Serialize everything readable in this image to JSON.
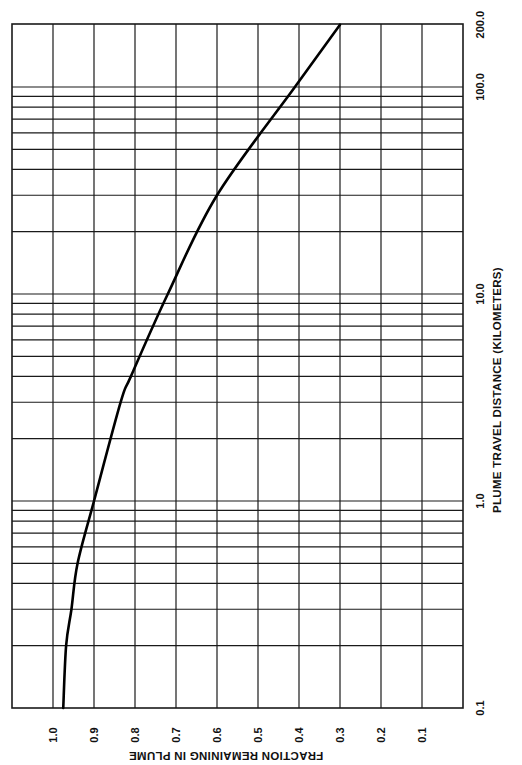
{
  "chart_data": {
    "type": "line",
    "orientation": "rotated-90-clockwise",
    "title": "",
    "xlabel": "PLUME TRAVEL DISTANCE (KILOMETERS)",
    "ylabel": "FRACTION REMAINING IN PLUME",
    "x_scale": "log",
    "xlim": [
      0.1,
      200.0
    ],
    "ylim": [
      0.0,
      1.1
    ],
    "grid": true,
    "legend": null,
    "x_tick_labels": [
      "0.1",
      "1.0",
      "10.0",
      "100.0",
      "200.0"
    ],
    "y_tick_labels": [
      "1.0",
      "0.9",
      "0.8",
      "0.7",
      "0.6",
      "0.5",
      "0.4",
      "0.3",
      "0.2",
      "0.1"
    ],
    "series": [
      {
        "name": "Fraction remaining",
        "x": [
          0.1,
          0.2,
          0.3,
          0.5,
          1.0,
          3.0,
          4.0,
          10.0,
          30.0,
          100.0,
          200.0
        ],
        "values": [
          0.975,
          0.968,
          0.955,
          0.94,
          0.9,
          0.835,
          0.81,
          0.72,
          0.6,
          0.41,
          0.3
        ]
      }
    ]
  }
}
